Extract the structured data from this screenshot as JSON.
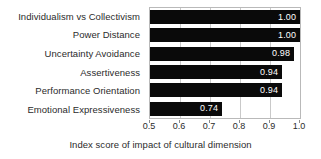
{
  "chart_data": {
    "type": "bar",
    "orientation": "horizontal",
    "title": "",
    "subtitle": "",
    "xlabel": "Index score of impact of cultural dimension",
    "ylabel": "",
    "categories": [
      "Individualism vs Collectivism",
      "Power Distance",
      "Uncertainty Avoidance",
      "Assertiveness",
      "Performance Orientation",
      "Emotional Expressiveness"
    ],
    "values": [
      1.0,
      1.0,
      0.98,
      0.94,
      0.94,
      0.74
    ],
    "value_labels": [
      "1.00",
      "1.00",
      "0.98",
      "0.94",
      "0.94",
      "0.74"
    ],
    "xlim": [
      0.5,
      1.0
    ],
    "xticks": [
      0.5,
      0.6,
      0.7,
      0.8,
      0.9,
      1.0
    ],
    "xtick_labels": [
      "0.5",
      "0.6",
      "0.7",
      "0.8",
      "0.9",
      "1.0"
    ],
    "grid": true,
    "grid_axis": "x",
    "legend": false,
    "legend_position": "none",
    "bar_color": "#0a0a0a",
    "value_label_color": "#ffffff",
    "text_color": "#2b2b2b",
    "grid_color": "#c9c9c9",
    "frame_color": "#b9b9b9",
    "background": "#ffffff"
  }
}
